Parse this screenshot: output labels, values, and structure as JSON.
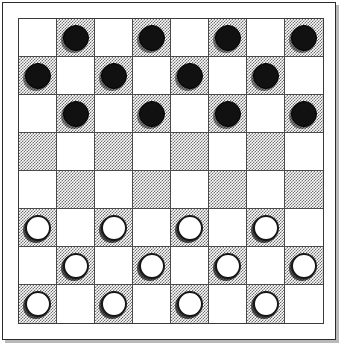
{
  "board": {
    "title": "Checkers Board",
    "columns": 8,
    "rows": 8,
    "colors": {
      "light_square": "#ffffff",
      "dark_square": "#6f6f6f",
      "grid_line": "#4a4a4a",
      "frame_border": "#2b2b2b",
      "frame_background": "#ffffff",
      "frame_shadow": "#b9b9b9",
      "black_piece": "#111111",
      "white_piece": "#ffffff",
      "piece_outline": "#161616"
    },
    "dark_square_rule": "(row + col) is odd",
    "piece_counts": {
      "black": 12,
      "white": 12
    },
    "rows_data": [
      {
        "index": 0,
        "label": "row-1",
        "cells": [
          {
            "col": 0,
            "shade": "light",
            "piece": null
          },
          {
            "col": 1,
            "shade": "dark",
            "piece": "black"
          },
          {
            "col": 2,
            "shade": "light",
            "piece": null
          },
          {
            "col": 3,
            "shade": "dark",
            "piece": "black"
          },
          {
            "col": 4,
            "shade": "light",
            "piece": null
          },
          {
            "col": 5,
            "shade": "dark",
            "piece": "black"
          },
          {
            "col": 6,
            "shade": "light",
            "piece": null
          },
          {
            "col": 7,
            "shade": "dark",
            "piece": "black"
          }
        ]
      },
      {
        "index": 1,
        "label": "row-2",
        "cells": [
          {
            "col": 0,
            "shade": "dark",
            "piece": "black"
          },
          {
            "col": 1,
            "shade": "light",
            "piece": null
          },
          {
            "col": 2,
            "shade": "dark",
            "piece": "black"
          },
          {
            "col": 3,
            "shade": "light",
            "piece": null
          },
          {
            "col": 4,
            "shade": "dark",
            "piece": "black"
          },
          {
            "col": 5,
            "shade": "light",
            "piece": null
          },
          {
            "col": 6,
            "shade": "dark",
            "piece": "black"
          },
          {
            "col": 7,
            "shade": "light",
            "piece": null
          }
        ]
      },
      {
        "index": 2,
        "label": "row-3",
        "cells": [
          {
            "col": 0,
            "shade": "light",
            "piece": null
          },
          {
            "col": 1,
            "shade": "dark",
            "piece": "black"
          },
          {
            "col": 2,
            "shade": "light",
            "piece": null
          },
          {
            "col": 3,
            "shade": "dark",
            "piece": "black"
          },
          {
            "col": 4,
            "shade": "light",
            "piece": null
          },
          {
            "col": 5,
            "shade": "dark",
            "piece": "black"
          },
          {
            "col": 6,
            "shade": "light",
            "piece": null
          },
          {
            "col": 7,
            "shade": "dark",
            "piece": "black"
          }
        ]
      },
      {
        "index": 3,
        "label": "row-4",
        "cells": [
          {
            "col": 0,
            "shade": "dark",
            "piece": null
          },
          {
            "col": 1,
            "shade": "light",
            "piece": null
          },
          {
            "col": 2,
            "shade": "dark",
            "piece": null
          },
          {
            "col": 3,
            "shade": "light",
            "piece": null
          },
          {
            "col": 4,
            "shade": "dark",
            "piece": null
          },
          {
            "col": 5,
            "shade": "light",
            "piece": null
          },
          {
            "col": 6,
            "shade": "dark",
            "piece": null
          },
          {
            "col": 7,
            "shade": "light",
            "piece": null
          }
        ]
      },
      {
        "index": 4,
        "label": "row-5",
        "cells": [
          {
            "col": 0,
            "shade": "light",
            "piece": null
          },
          {
            "col": 1,
            "shade": "dark",
            "piece": null
          },
          {
            "col": 2,
            "shade": "light",
            "piece": null
          },
          {
            "col": 3,
            "shade": "dark",
            "piece": null
          },
          {
            "col": 4,
            "shade": "light",
            "piece": null
          },
          {
            "col": 5,
            "shade": "dark",
            "piece": null
          },
          {
            "col": 6,
            "shade": "light",
            "piece": null
          },
          {
            "col": 7,
            "shade": "dark",
            "piece": null
          }
        ]
      },
      {
        "index": 5,
        "label": "row-6",
        "cells": [
          {
            "col": 0,
            "shade": "dark",
            "piece": "white"
          },
          {
            "col": 1,
            "shade": "light",
            "piece": null
          },
          {
            "col": 2,
            "shade": "dark",
            "piece": "white"
          },
          {
            "col": 3,
            "shade": "light",
            "piece": null
          },
          {
            "col": 4,
            "shade": "dark",
            "piece": "white"
          },
          {
            "col": 5,
            "shade": "light",
            "piece": null
          },
          {
            "col": 6,
            "shade": "dark",
            "piece": "white"
          },
          {
            "col": 7,
            "shade": "light",
            "piece": null
          }
        ]
      },
      {
        "index": 6,
        "label": "row-7",
        "cells": [
          {
            "col": 0,
            "shade": "light",
            "piece": null
          },
          {
            "col": 1,
            "shade": "dark",
            "piece": "white"
          },
          {
            "col": 2,
            "shade": "light",
            "piece": null
          },
          {
            "col": 3,
            "shade": "dark",
            "piece": "white"
          },
          {
            "col": 4,
            "shade": "light",
            "piece": null
          },
          {
            "col": 5,
            "shade": "dark",
            "piece": "white"
          },
          {
            "col": 6,
            "shade": "light",
            "piece": null
          },
          {
            "col": 7,
            "shade": "dark",
            "piece": "white"
          }
        ]
      },
      {
        "index": 7,
        "label": "row-8",
        "cells": [
          {
            "col": 0,
            "shade": "dark",
            "piece": "white"
          },
          {
            "col": 1,
            "shade": "light",
            "piece": null
          },
          {
            "col": 2,
            "shade": "dark",
            "piece": "white"
          },
          {
            "col": 3,
            "shade": "light",
            "piece": null
          },
          {
            "col": 4,
            "shade": "dark",
            "piece": "white"
          },
          {
            "col": 5,
            "shade": "light",
            "piece": null
          },
          {
            "col": 6,
            "shade": "dark",
            "piece": "white"
          },
          {
            "col": 7,
            "shade": "light",
            "piece": null
          }
        ]
      }
    ]
  }
}
